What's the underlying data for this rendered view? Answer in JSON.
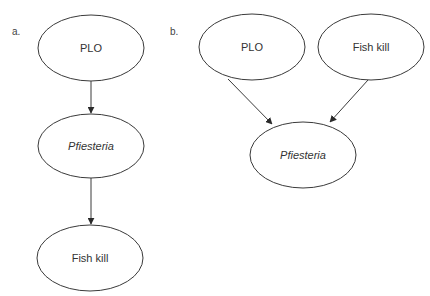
{
  "panels": [
    {
      "label": "a.",
      "nodes": [
        {
          "id": "a-plo",
          "text": "PLO",
          "italic": false
        },
        {
          "id": "a-pfiesteria",
          "text": "Pfiesteria",
          "italic": true
        },
        {
          "id": "a-fishkill",
          "text": "Fish kill",
          "italic": false
        }
      ],
      "edges": [
        {
          "from": "PLO",
          "to": "Pfiesteria"
        },
        {
          "from": "Pfiesteria",
          "to": "Fish kill"
        }
      ]
    },
    {
      "label": "b.",
      "nodes": [
        {
          "id": "b-plo",
          "text": "PLO",
          "italic": false
        },
        {
          "id": "b-fishkill",
          "text": "Fish kill",
          "italic": false
        },
        {
          "id": "b-pfiesteria",
          "text": "Pfiesteria",
          "italic": true
        }
      ],
      "edges": [
        {
          "from": "PLO",
          "to": "Pfiesteria"
        },
        {
          "from": "Fish kill",
          "to": "Pfiesteria"
        }
      ]
    }
  ],
  "colors": {
    "stroke": "#3a3a3a",
    "text": "#333333",
    "background": "#ffffff"
  }
}
